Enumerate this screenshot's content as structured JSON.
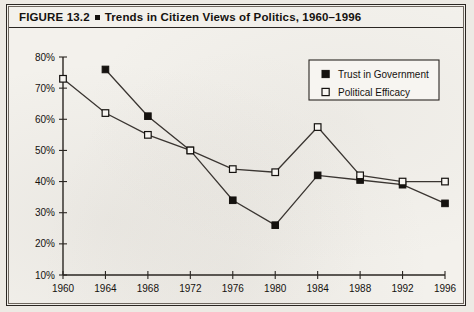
{
  "figure": {
    "label": "FIGURE 13.2",
    "separator_icon": "filled-square-bullet",
    "title": "Trends in Citizen Views of Politics, 1960–1996",
    "full_title": "FIGURE 13.2 ■ Trends in Citizen Views of Politics, 1960–1996"
  },
  "chart_data": {
    "type": "line",
    "title": "Trends in Citizen Views of Politics, 1960–1996",
    "xlabel": "",
    "ylabel": "",
    "x": [
      1960,
      1964,
      1968,
      1972,
      1976,
      1980,
      1984,
      1988,
      1992,
      1996
    ],
    "categories": [
      "1960",
      "1964",
      "1968",
      "1972",
      "1976",
      "1980",
      "1984",
      "1988",
      "1992",
      "1996"
    ],
    "xlim": [
      1960,
      1996
    ],
    "ylim": [
      10,
      80
    ],
    "ytick_labels": [
      "10%",
      "20%",
      "30%",
      "40%",
      "50%",
      "60%",
      "70%",
      "80%"
    ],
    "ytick_values": [
      10,
      20,
      30,
      40,
      50,
      60,
      70,
      80
    ],
    "xtick_labels": [
      "1960",
      "1964",
      "1968",
      "1972",
      "1976",
      "1980",
      "1984",
      "1988",
      "1992",
      "1996"
    ],
    "grid": false,
    "legend_position": "top-right",
    "series": [
      {
        "name": "Trust in Government",
        "marker": "filled-square",
        "color": "#15120f",
        "values": [
          null,
          76,
          61,
          50,
          34,
          26,
          42,
          40.5,
          39,
          33
        ]
      },
      {
        "name": "Political Efficacy",
        "marker": "open-square",
        "color": "#15120f",
        "values": [
          73,
          62,
          55,
          50,
          44,
          43,
          57.5,
          42,
          40,
          40
        ]
      }
    ]
  },
  "legend": {
    "items": [
      {
        "label": "Trust in Government",
        "marker": "filled-square"
      },
      {
        "label": "Political Efficacy",
        "marker": "open-square"
      }
    ]
  }
}
